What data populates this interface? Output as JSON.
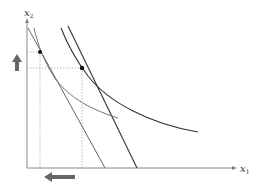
{
  "diagram": {
    "type": "consumer-choice",
    "axes": {
      "x_label": "x",
      "x_subscript": "1",
      "y_label": "x",
      "y_subscript": "2"
    },
    "colors": {
      "axis": "#888888",
      "budget_line_old": "#333333",
      "budget_line_new": "#555555",
      "indifference_high": "#333333",
      "indifference_low": "#777777",
      "guide": "#aaaaaa",
      "arrow": "#666666",
      "point": "#111111"
    },
    "points": [
      {
        "name": "optimum-new",
        "x": 40,
        "y": 52
      },
      {
        "name": "optimum-old",
        "x": 82,
        "y": 68
      }
    ],
    "arrows": [
      {
        "name": "x2-increase",
        "direction": "up"
      },
      {
        "name": "x1-decrease",
        "direction": "left"
      }
    ]
  }
}
